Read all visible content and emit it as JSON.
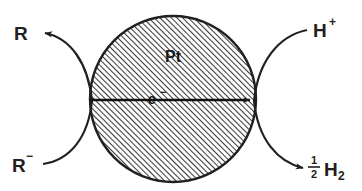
{
  "figure": {
    "particle": {
      "label": "Pt",
      "name": "platinum-particle",
      "fill_pattern": "diagonal-hatch",
      "hatch_color": "#3a3a3a",
      "outline_color": "#231f20",
      "center_x": 173,
      "center_y": 99,
      "radius": 83
    },
    "electron_arrow": {
      "label": "e",
      "charge": "−",
      "direction": "right",
      "name": "electron-transfer-arrow"
    },
    "species": [
      {
        "id": "reactant-oxidized",
        "label": "R",
        "charge": "",
        "position": "top-left",
        "arrowhead": true,
        "arrow_direction": "left"
      },
      {
        "id": "reactant-reduced",
        "label": "R",
        "charge": "−",
        "position": "bottom-left",
        "arrowhead": false,
        "arrow_direction": "right"
      },
      {
        "id": "proton",
        "label": "H",
        "charge": "+",
        "position": "top-right",
        "arrowhead": false,
        "arrow_direction": "left"
      },
      {
        "id": "hydrogen",
        "label": "H",
        "subscript": "2",
        "coefficient_numerator": "1",
        "coefficient_denominator": "2",
        "position": "bottom-right",
        "arrowhead": true,
        "arrow_direction": "right"
      }
    ],
    "colors": {
      "background": "#ffffff",
      "ink": "#231f20",
      "hatch": "#3a3a3a"
    }
  }
}
